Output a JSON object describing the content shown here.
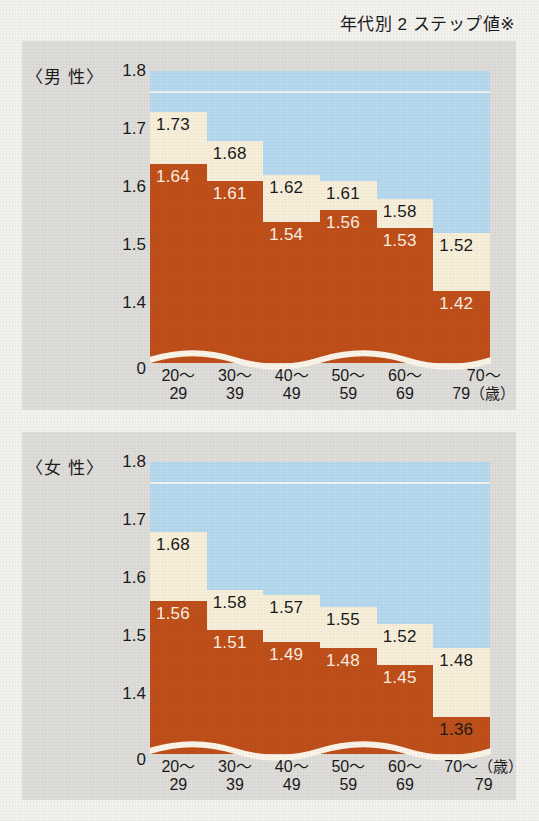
{
  "title": "年代別 2 ステップ値※",
  "colors": {
    "band_blue": "#b7daf0",
    "bar_cream": "#f9f0dc",
    "bar_orange": "#c0501a",
    "panel_gray": "#dfdedb",
    "paper": "#f4f3ef",
    "text_dark": "#1b1b1b",
    "text_light": "#fbf1e2"
  },
  "charts": [
    {
      "key": "male",
      "series_label": "〈男 性〉",
      "unit": "（歳）",
      "unit_position": "second-line",
      "yticks": [
        "1.8",
        "1.7",
        "1.6",
        "1.5",
        "1.4",
        "0"
      ],
      "categories_l1": [
        "20～",
        "30～",
        "40～",
        "50～",
        "60～",
        "70～"
      ],
      "categories_l2": [
        "29",
        "39",
        "49",
        "59",
        "69",
        "79"
      ],
      "cream": [
        "1.73",
        "1.68",
        "1.62",
        "1.61",
        "1.58",
        "1.52"
      ],
      "orange": [
        "1.64",
        "1.61",
        "1.54",
        "1.56",
        "1.53",
        "1.42"
      ]
    },
    {
      "key": "female",
      "series_label": "〈女 性〉",
      "unit": "（歳）",
      "unit_position": "first-line",
      "yticks": [
        "1.8",
        "1.7",
        "1.6",
        "1.5",
        "1.4",
        "0"
      ],
      "categories_l1": [
        "20～",
        "30～",
        "40～",
        "50～",
        "60～",
        "70～"
      ],
      "categories_l2": [
        "29",
        "39",
        "49",
        "59",
        "69",
        "79"
      ],
      "cream": [
        "1.68",
        "1.58",
        "1.57",
        "1.55",
        "1.52",
        "1.48"
      ],
      "orange": [
        "1.56",
        "1.51",
        "1.49",
        "1.48",
        "1.45",
        "1.36"
      ]
    }
  ],
  "chart_data": [
    {
      "type": "bar",
      "title": "年代別 2 ステップ値※",
      "subtitle": "〈男 性〉",
      "xlabel": "（歳）",
      "ylabel": "",
      "ylim": [
        1.3,
        1.8
      ],
      "yticks": [
        1.4,
        1.5,
        1.6,
        1.7,
        1.8
      ],
      "y_axis_break": true,
      "y_axis_zero_label": "0",
      "grid": false,
      "legend": "none",
      "categories": [
        "20～29",
        "30～39",
        "40～49",
        "50～59",
        "60～69",
        "70～79"
      ],
      "series": [
        {
          "name": "上限値（クリーム）",
          "values": [
            1.73,
            1.68,
            1.62,
            1.61,
            1.58,
            1.52
          ]
        },
        {
          "name": "下限値（オレンジ）",
          "values": [
            1.64,
            1.61,
            1.54,
            1.56,
            1.53,
            1.42
          ]
        }
      ]
    },
    {
      "type": "bar",
      "title": "年代別 2 ステップ値※",
      "subtitle": "〈女 性〉",
      "xlabel": "（歳）",
      "ylabel": "",
      "ylim": [
        1.3,
        1.8
      ],
      "yticks": [
        1.4,
        1.5,
        1.6,
        1.7,
        1.8
      ],
      "y_axis_break": true,
      "y_axis_zero_label": "0",
      "grid": false,
      "legend": "none",
      "categories": [
        "20～29",
        "30～39",
        "40～49",
        "50～59",
        "60～69",
        "70～79"
      ],
      "series": [
        {
          "name": "上限値（クリーム）",
          "values": [
            1.68,
            1.58,
            1.57,
            1.55,
            1.52,
            1.48
          ]
        },
        {
          "name": "下限値（オレンジ）",
          "values": [
            1.56,
            1.51,
            1.49,
            1.48,
            1.45,
            1.36
          ]
        }
      ]
    }
  ]
}
